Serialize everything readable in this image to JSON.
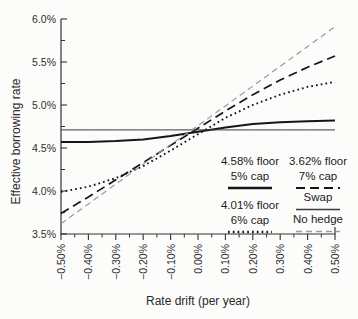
{
  "figure": {
    "background": "#fcfcfb",
    "text_color": "#2a2a2a"
  },
  "chart_data": {
    "type": "line",
    "title": "",
    "xlabel": "Rate drift (per year)",
    "ylabel": "Effective borrowing rate",
    "xlim": [
      -0.5,
      0.5
    ],
    "ylim": [
      3.5,
      6.0
    ],
    "grid": false,
    "axis_color": "#333333",
    "legend_position": "inside lower-right, two columns",
    "x_ticks": [
      {
        "value": -0.5,
        "label": "−0.50%"
      },
      {
        "value": -0.4,
        "label": "−0.40%"
      },
      {
        "value": -0.3,
        "label": "−0.30%"
      },
      {
        "value": -0.2,
        "label": "−0.20%"
      },
      {
        "value": -0.1,
        "label": "−0.10%"
      },
      {
        "value": 0.0,
        "label": "0.00%"
      },
      {
        "value": 0.1,
        "label": "0.10%"
      },
      {
        "value": 0.2,
        "label": "0.20%"
      },
      {
        "value": 0.3,
        "label": "0.30%"
      },
      {
        "value": 0.4,
        "label": "0.40%"
      },
      {
        "value": 0.5,
        "label": "0.50%"
      }
    ],
    "x_minor_ticks": [
      -0.45,
      -0.35,
      -0.25,
      -0.15,
      -0.05,
      0.05,
      0.15,
      0.25,
      0.35,
      0.45
    ],
    "y_ticks": [
      {
        "value": 3.5,
        "label": "3.5%"
      },
      {
        "value": 4.0,
        "label": "4.0%"
      },
      {
        "value": 4.5,
        "label": "4.5%"
      },
      {
        "value": 5.0,
        "label": "5.0%"
      },
      {
        "value": 5.5,
        "label": "5.5%"
      },
      {
        "value": 6.0,
        "label": "6.0%"
      }
    ],
    "y_minor_ticks": [
      3.75,
      4.25,
      4.75,
      5.25,
      5.75
    ],
    "x": [
      -0.5,
      -0.4,
      -0.3,
      -0.2,
      -0.1,
      0.0,
      0.1,
      0.2,
      0.3,
      0.4,
      0.5
    ],
    "series": [
      {
        "id": "collar-458-floor-5-cap",
        "name": "4.58% floor / 5% cap",
        "style": "solid-thick",
        "color": "#161616",
        "width": 2,
        "dash": "",
        "values": [
          4.57,
          4.57,
          4.58,
          4.6,
          4.64,
          4.69,
          4.74,
          4.78,
          4.8,
          4.81,
          4.82
        ]
      },
      {
        "id": "collar-362-floor-7-cap",
        "name": "3.62% floor / 7% cap",
        "style": "long-dash",
        "color": "#161616",
        "width": 1.7,
        "dash": "9,5",
        "values": [
          3.74,
          3.93,
          4.13,
          4.33,
          4.53,
          4.73,
          4.93,
          5.12,
          5.29,
          5.44,
          5.57
        ]
      },
      {
        "id": "collar-401-floor-6-cap",
        "name": "4.01% floor / 6% cap",
        "style": "dotted",
        "color": "#161616",
        "width": 1.9,
        "dash": "1.7,3.1",
        "values": [
          3.99,
          4.05,
          4.15,
          4.29,
          4.47,
          4.66,
          4.85,
          5.0,
          5.12,
          5.21,
          5.27
        ]
      },
      {
        "id": "swap",
        "name": "Swap",
        "style": "solid-thin",
        "color": "#3a3a3a",
        "width": 1,
        "dash": "",
        "values": [
          4.71,
          4.71,
          4.71,
          4.71,
          4.71,
          4.71,
          4.71,
          4.71,
          4.71,
          4.71,
          4.71
        ]
      },
      {
        "id": "no-hedge",
        "name": "No hedge",
        "style": "thin-dash-gray",
        "color": "#9b9b9b",
        "width": 1.2,
        "dash": "6,4",
        "values": [
          3.62,
          3.85,
          4.08,
          4.31,
          4.54,
          4.76,
          4.99,
          5.22,
          5.45,
          5.68,
          5.91
        ]
      }
    ]
  },
  "legend": {
    "items": [
      {
        "line1": "4.58% floor",
        "line2": "5% cap"
      },
      {
        "line1": "4.01% floor",
        "line2": "6% cap"
      },
      {
        "line1": "3.62% floor",
        "line2": "7% cap"
      },
      {
        "line1": "Swap"
      },
      {
        "line1": "No hedge"
      }
    ]
  }
}
